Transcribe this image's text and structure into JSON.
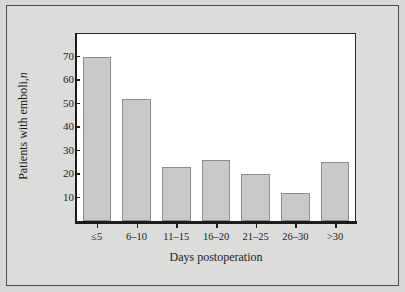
{
  "figure": {
    "background_color": "#d8d8d7",
    "plot_background_color": "#ffffff",
    "frame_color": "#4a4a4a",
    "axis_color": "#1c1c1c",
    "bar_fill_color": "#c9c9c9",
    "bar_edge_color": "#8c8c8c"
  },
  "chart_data": {
    "type": "bar",
    "title": "",
    "subtitle": "",
    "xlabel": "Days postoperation",
    "ylabel": "Patients with emboli, n",
    "ylabel_plain": "Patients with emboli,",
    "ylabel_italic": "n",
    "categories": [
      "≤5",
      "6–10",
      "11–15",
      "16–20",
      "21–25",
      "26–30",
      ">30"
    ],
    "values": [
      70,
      52,
      23,
      26,
      20,
      12,
      25
    ],
    "ylim": [
      0,
      80
    ],
    "yticks": [
      10,
      20,
      30,
      40,
      50,
      60,
      70
    ],
    "ytick_labels": [
      "10",
      "20",
      "30",
      "40",
      "50",
      "60",
      "70"
    ],
    "grid": false,
    "legend": false,
    "legend_position": "none"
  }
}
